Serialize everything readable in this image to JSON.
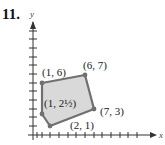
{
  "problem_number": "11.",
  "axes": {
    "x_label": "x",
    "y_label": "y"
  },
  "vertices": [
    {
      "label": "(1, 6)",
      "x": 1,
      "y": 6
    },
    {
      "label": "(6, 7)",
      "x": 6,
      "y": 7
    },
    {
      "label": "(7, 3)",
      "x": 7,
      "y": 3
    },
    {
      "label": "(2, 1)",
      "x": 2,
      "y": 1
    },
    {
      "label": "(1, 2½)",
      "x": 1,
      "y": 2.5
    }
  ],
  "colors": {
    "fill": "#d9d9d9",
    "edge": "#707070",
    "axis": "#333333"
  }
}
